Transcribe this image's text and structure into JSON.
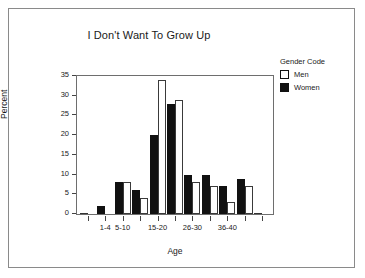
{
  "chart_data": {
    "type": "bar",
    "title": "I Don't Want To Grow Up",
    "xlabel": "Age",
    "ylabel": "Percent",
    "ylim": [
      0,
      35
    ],
    "yticks": [
      0,
      5,
      10,
      15,
      20,
      25,
      30,
      35
    ],
    "grid": false,
    "legend_position": "right",
    "legend_title": "Gender Code",
    "categories": [
      "",
      "1-4",
      "5-10",
      "",
      "15-20",
      "",
      "26-30",
      "",
      "36-40",
      "",
      ""
    ],
    "tick_labels": [
      "",
      "1-4",
      "5-10",
      "",
      "15-20",
      "",
      "26-30",
      "",
      "36-40",
      "",
      ""
    ],
    "series": [
      {
        "name": "Women",
        "color": "#111111",
        "values": [
          0,
          2,
          8,
          6,
          20,
          28,
          10,
          10,
          7,
          9,
          0
        ]
      },
      {
        "name": "Men",
        "color": "#ffffff",
        "values": [
          0,
          0,
          8,
          4,
          34,
          29,
          8,
          7,
          3,
          7,
          0
        ]
      }
    ]
  },
  "legend": {
    "title": "Gender Code",
    "entries": [
      {
        "label": "Men",
        "swatch": "hollow-square-icon"
      },
      {
        "label": "Women",
        "swatch": "filled-square-icon"
      }
    ]
  }
}
